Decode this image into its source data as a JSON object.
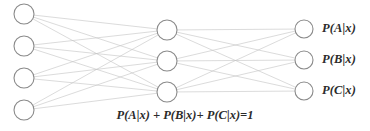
{
  "diagram": {
    "type": "neural-network",
    "background_color": "#ffffff",
    "node_stroke_color": "#8a8a8a",
    "node_fill_color": "#ffffff",
    "edge_color": "#c2c2c2",
    "text_color": "#2b2b2b",
    "layers": [
      {
        "name": "input-layer",
        "node_count": 4,
        "radius": 10,
        "cx": 24,
        "node_cy": [
          14,
          46,
          78,
          110
        ]
      },
      {
        "name": "hidden-layer",
        "node_count": 3,
        "radius": 10,
        "cx": 167,
        "node_cy": [
          30,
          61,
          92
        ]
      },
      {
        "name": "output-layer",
        "node_count": 3,
        "radius": 9,
        "cx": 304,
        "node_cy": [
          29,
          60,
          91
        ]
      }
    ],
    "output_labels": [
      {
        "text": "P(A|x)",
        "x": 322,
        "y": 21
      },
      {
        "text": "P(B|x)",
        "x": 322,
        "y": 52
      },
      {
        "text": "P(C|x)",
        "x": 322,
        "y": 83
      }
    ],
    "equation": "P(A|x) + P(B|x)+ P(C|x)=1"
  }
}
